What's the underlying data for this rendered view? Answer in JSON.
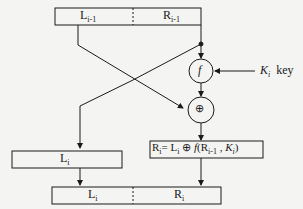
{
  "diagram": {
    "top_block": {
      "left": "L",
      "left_sub": "i-1",
      "right": "R",
      "right_sub": "i-1"
    },
    "function_node": {
      "label": "f"
    },
    "key": {
      "symbol": "K",
      "sub": "i",
      "label": "key"
    },
    "xor_node": {
      "label": "⊕"
    },
    "middle_left": {
      "text": "L",
      "sub": "i"
    },
    "middle_right": {
      "lhs": "R",
      "lhs_sub": "i",
      "eq": "= L",
      "eq_sub": "i",
      "op": " ⊕ ",
      "f": "f",
      "args_open": "(R",
      "args_sub": "i-1",
      "comma": " , ",
      "k": "K",
      "k_sub": "i",
      "close": ")"
    },
    "bottom_block": {
      "left": "L",
      "left_sub": "i",
      "right": "R",
      "right_sub": "i"
    }
  }
}
